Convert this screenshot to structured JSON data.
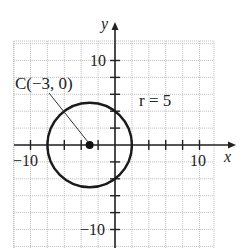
{
  "diagram": {
    "type": "circle-on-coordinate-plane",
    "axes": {
      "x_label": "x",
      "y_label": "y",
      "x_tick_labels": [
        {
          "value": -10,
          "text": "−10"
        },
        {
          "value": 10,
          "text": "10"
        }
      ],
      "y_tick_labels": [
        {
          "value": 10,
          "text": "10"
        },
        {
          "value": -10,
          "text": "−10"
        }
      ],
      "tick_spacing": 2,
      "grid_spacing": 2
    },
    "circle": {
      "center": {
        "x": -3,
        "y": 0
      },
      "radius": 5
    },
    "labels": {
      "center_label": "C(−3, 0)",
      "radius_label": "r = 5"
    },
    "colors": {
      "grid": "#b8b8b8",
      "axis": "#222222",
      "circle": "#1a1a1a",
      "background": "#ffffff"
    }
  }
}
